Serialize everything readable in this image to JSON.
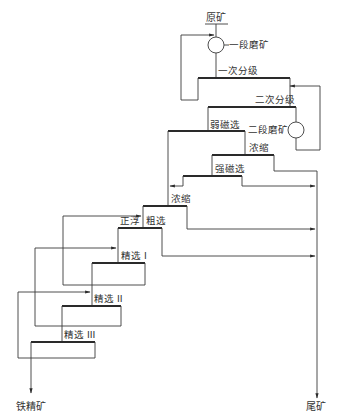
{
  "diagram": {
    "type": "mineral-processing-flowsheet",
    "colors": {
      "line": "#3a3a3a",
      "text": "#333333",
      "background": "#ffffff"
    },
    "input": {
      "label": "原矿"
    },
    "outputs": {
      "concentrate": {
        "label": "铁精矿"
      },
      "tailings": {
        "label": "尾矿"
      }
    },
    "stages": [
      {
        "id": "grind1",
        "label": "一段磨矿",
        "kind": "grinding"
      },
      {
        "id": "class1",
        "label": "一次分级",
        "kind": "classification"
      },
      {
        "id": "class2",
        "label": "二次分级",
        "kind": "classification"
      },
      {
        "id": "grind2",
        "label": "二段磨矿",
        "kind": "grinding"
      },
      {
        "id": "wms",
        "label": "弱磁选",
        "kind": "separation"
      },
      {
        "id": "thick1",
        "label": "浓缩",
        "kind": "thickening"
      },
      {
        "id": "hms",
        "label": "强磁选",
        "kind": "separation"
      },
      {
        "id": "thick2",
        "label": "浓缩",
        "kind": "thickening"
      },
      {
        "id": "float_prefix",
        "label": "正浮",
        "kind": "flotation"
      },
      {
        "id": "rough",
        "label": "粗选",
        "kind": "flotation"
      },
      {
        "id": "clean1",
        "label": "精选 I",
        "kind": "flotation"
      },
      {
        "id": "clean2",
        "label": "精选 II",
        "kind": "flotation"
      },
      {
        "id": "clean3",
        "label": "精选 III",
        "kind": "flotation",
        "label_note": "numeral partly illegible in source; III inferred from I, II sequence"
      }
    ]
  }
}
